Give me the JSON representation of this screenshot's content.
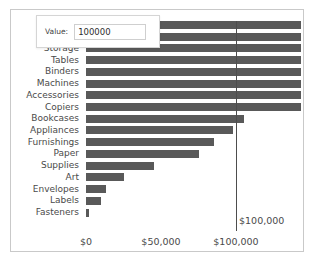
{
  "control_panel": {
    "label": "Value:",
    "input_value": "100000",
    "input_placeholder": ""
  },
  "reference_line": {
    "label": "$100,000",
    "value": 100000
  },
  "chart_data": {
    "type": "bar",
    "orientation": "horizontal",
    "title": "",
    "xlabel": "",
    "ylabel": "",
    "xlim": [
      0,
      143000
    ],
    "grid": false,
    "legend": false,
    "bar_color": "#595959",
    "xticks": [
      0,
      50000,
      100000
    ],
    "xticklabels": [
      "$0",
      "$50,000",
      "$100,000"
    ],
    "note": "Top two bars are occluded by the floating Value panel; their category labels are not visible.",
    "categories": [
      "",
      "",
      "Storage",
      "Tables",
      "Binders",
      "Machines",
      "Accessories",
      "Copiers",
      "Bookcases",
      "Appliances",
      "Furnishings",
      "Paper",
      "Supplies",
      "Art",
      "Envelopes",
      "Labels",
      "Fasteners"
    ],
    "values": [
      143000,
      143000,
      143000,
      143000,
      143000,
      143000,
      143000,
      145000,
      105000,
      98000,
      85000,
      75000,
      45000,
      25000,
      13000,
      10000,
      2000
    ],
    "clipped_at_axis_max": [
      true,
      true,
      true,
      true,
      true,
      true,
      true,
      true,
      false,
      false,
      false,
      false,
      false,
      false,
      false,
      false,
      false
    ]
  }
}
